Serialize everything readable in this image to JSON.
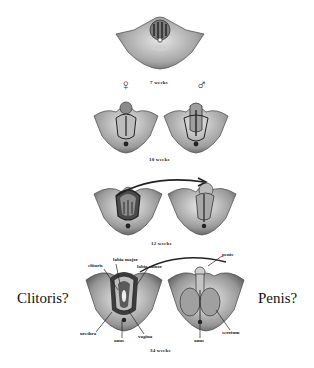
{
  "diagram": {
    "stages": [
      {
        "id": "7w",
        "label": "7 weeks"
      },
      {
        "id": "10w",
        "label": "10 weeks"
      },
      {
        "id": "12w",
        "label": "12 weeks"
      },
      {
        "id": "34w",
        "label": "34 weeks"
      }
    ],
    "sex_symbols": {
      "female": "♀",
      "male": "♂"
    },
    "female_labels": {
      "labia_major": "labia major",
      "clitoris": "clitoris",
      "labia_minor": "labia minor",
      "urethra": "urethra",
      "anus": "anus",
      "vagina": "vagina"
    },
    "male_labels": {
      "penis": "penis",
      "scrotum": "scrotum",
      "anus": "anus"
    },
    "annotations": {
      "left": "Clitoris?",
      "right": "Penis?"
    },
    "colors": {
      "tissue_light": "#d9d9d9",
      "tissue_mid": "#9a9a9a",
      "tissue_dark": "#3a3a3a",
      "line": "#222222"
    }
  }
}
